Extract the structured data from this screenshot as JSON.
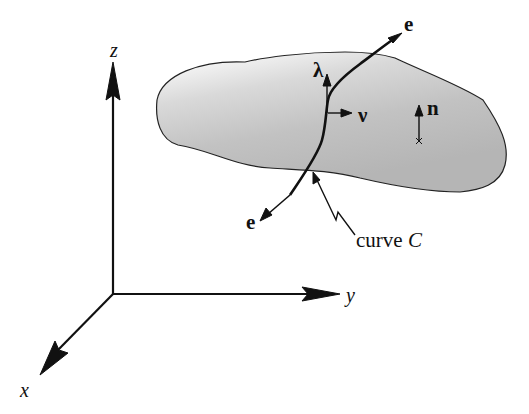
{
  "diagram": {
    "axes": {
      "x_label": "x",
      "y_label": "y",
      "z_label": "z"
    },
    "surface": {
      "fill_light": "#f4f4f4",
      "fill_dark": "#b8b8b8",
      "normal_label": "n"
    },
    "curve": {
      "label_prefix": "curve ",
      "label_name": "C",
      "tangent_top_label": "e",
      "tangent_bottom_label": "e",
      "lambda_label": "λ",
      "nu_label": "ν"
    },
    "colors": {
      "stroke": "#111111",
      "background": "#ffffff"
    }
  }
}
